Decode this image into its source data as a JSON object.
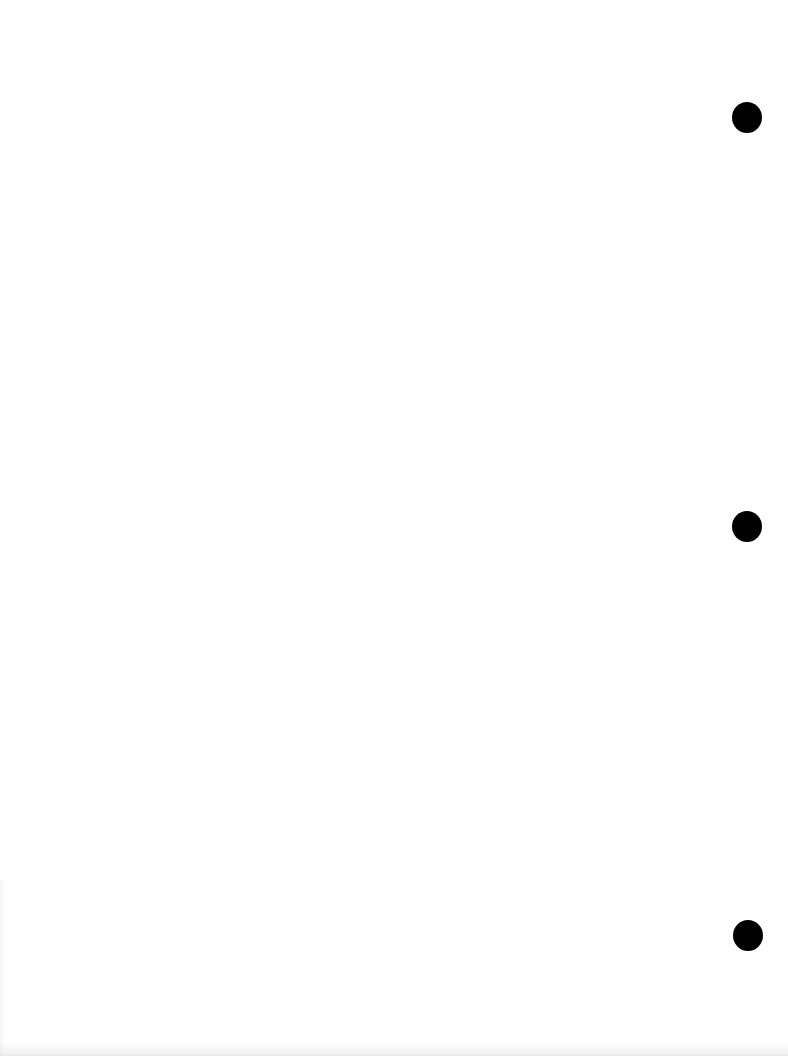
{
  "page": {
    "type": "blank scanned sheet",
    "background_color": "#ffffff",
    "text_content": ""
  },
  "punch_holes": [
    {
      "cx": 747,
      "cy": 117,
      "diameter": 30,
      "color": "#000000"
    },
    {
      "cx": 747,
      "cy": 526,
      "diameter": 30,
      "color": "#000000"
    },
    {
      "cx": 748,
      "cy": 935,
      "diameter": 30,
      "color": "#000000"
    }
  ]
}
